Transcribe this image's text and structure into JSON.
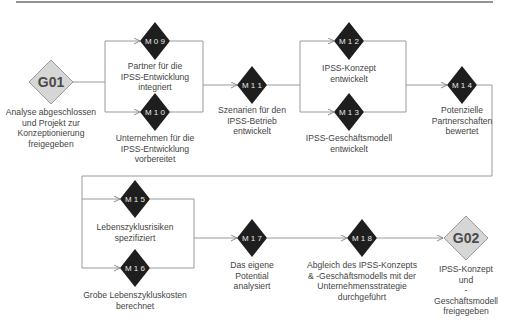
{
  "colors": {
    "milestone_fill": "#1e1e1e",
    "milestone_text": "#e8e8e8",
    "gate_fill": "#d6d6d6",
    "gate_stroke": "#9a9a9a",
    "gate_text": "#4a4a4a",
    "connector": "#9a9a9a",
    "top_rule": "#6e6e6e",
    "label_text": "#444444"
  },
  "gates": [
    {
      "id": "G01",
      "code": "G01",
      "label": "Analyse abgeschlossen\nund Projekt zur\nKonzeptionierung\nfreigegeben"
    },
    {
      "id": "G02",
      "code": "G02",
      "label": "IPSS-Konzept und\n-Geschäftsmodell\nfreigegeben"
    }
  ],
  "milestones": [
    {
      "id": "M09",
      "code": "M 0 9",
      "label": "Partner für die\nIPSS-Entwicklung\nintegriert"
    },
    {
      "id": "M10",
      "code": "M 1 0",
      "label": "Unternehmen für die\nIPSS-Entwicklung\nvorbereitet"
    },
    {
      "id": "M11",
      "code": "M 1 1",
      "label": "Szenarien für den\nIPSS-Betrieb\nentwickelt"
    },
    {
      "id": "M12",
      "code": "M 1 2",
      "label": "IPSS-Konzept\nentwickelt"
    },
    {
      "id": "M13",
      "code": "M 1 3",
      "label": "IPSS-Geschäftsmodell\nentwickelt"
    },
    {
      "id": "M14",
      "code": "M 1 4",
      "label": "Potenzielle\nPartnerschaften\nbewertet"
    },
    {
      "id": "M15",
      "code": "M 1 5",
      "label": "Lebenszyklusrisiken\nspezifiziert"
    },
    {
      "id": "M16",
      "code": "M 1 6",
      "label": "Grobe Lebenszykluskosten\nberechnet"
    },
    {
      "id": "M17",
      "code": "M 1 7",
      "label": "Das eigene\nPotential\nanalysiert"
    },
    {
      "id": "M18",
      "code": "M 1 8",
      "label": "Abgleich des IPSS-Konzepts\n& -Geschäftsmodells mit der\nUnternehmensstrategie\ndurchgeführt"
    }
  ],
  "edges": [
    [
      "G01",
      "M09"
    ],
    [
      "G01",
      "M10"
    ],
    [
      "M09",
      "M11"
    ],
    [
      "M10",
      "M11"
    ],
    [
      "M11",
      "M12"
    ],
    [
      "M11",
      "M13"
    ],
    [
      "M12",
      "M14"
    ],
    [
      "M13",
      "M14"
    ],
    [
      "M14",
      "M15"
    ],
    [
      "M14",
      "M16"
    ],
    [
      "M15",
      "M17"
    ],
    [
      "M16",
      "M17"
    ],
    [
      "M17",
      "M18"
    ],
    [
      "M18",
      "G02"
    ]
  ]
}
